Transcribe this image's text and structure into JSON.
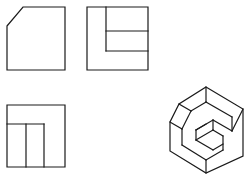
{
  "canvas": {
    "width": 250,
    "height": 179,
    "background": "#ffffff",
    "stroke": "#1a1a1a"
  },
  "views": [
    {
      "name": "front-view",
      "outline": "7,26 23,7 65,7 65,70 7,70",
      "lines": []
    },
    {
      "name": "side-view",
      "outline": "87,7 148,7 148,70 87,70",
      "lines": [
        [
          106,
          7,
          106,
          51
        ],
        [
          106,
          31,
          148,
          31
        ],
        [
          106,
          51,
          148,
          51
        ]
      ]
    },
    {
      "name": "top-view",
      "outline": "7,105 65,105 65,167 7,167",
      "lines": [
        [
          7,
          124,
          44,
          124
        ],
        [
          26,
          124,
          26,
          167
        ],
        [
          44,
          124,
          44,
          167
        ]
      ]
    },
    {
      "name": "isometric-view",
      "outline": "206,87 243,109 243,156 206,173 170,151 170,122 179,104",
      "lines": [
        [
          179,
          104,
          191,
          111
        ],
        [
          191,
          111,
          182,
          129
        ],
        [
          182,
          129,
          170,
          122
        ],
        [
          191,
          111,
          206,
          102
        ],
        [
          206,
          102,
          206,
          87
        ],
        [
          206,
          102,
          232,
          117
        ],
        [
          232,
          117,
          232,
          131
        ],
        [
          232,
          131,
          243,
          109
        ],
        [
          182,
          129,
          182,
          145
        ],
        [
          182,
          145,
          206,
          160
        ],
        [
          206,
          160,
          206,
          173
        ],
        [
          206,
          160,
          223,
          150
        ],
        [
          223,
          150,
          223,
          136
        ],
        [
          223,
          136,
          213,
          130
        ],
        [
          213,
          130,
          196,
          140
        ],
        [
          196,
          140,
          213,
          150
        ],
        [
          213,
          150,
          223,
          144
        ],
        [
          213,
          130,
          213,
          120
        ],
        [
          213,
          120,
          232,
          131
        ],
        [
          213,
          120,
          196,
          130
        ],
        [
          196,
          130,
          196,
          140
        ],
        [
          196,
          130,
          206,
          124
        ]
      ]
    }
  ]
}
